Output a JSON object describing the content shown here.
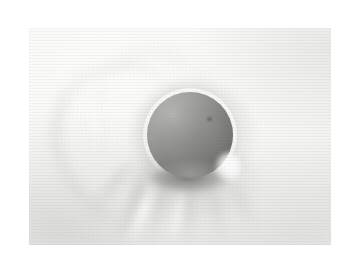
{
  "page": {
    "background_color": "#ffffff",
    "width": 359,
    "height": 261
  },
  "photo": {
    "subject": "gray ball resting on white cloth",
    "alt_text": "A soft gray spherical ball resting on a creased white fabric surface, lit from the upper left",
    "frame": {
      "x": 29,
      "y": 28,
      "width": 302,
      "height": 217
    },
    "background_color": "#f7f7f5",
    "lighting": "upper-left key light, soft diffuse shadow to lower right"
  },
  "elements": {
    "ball": {
      "name": "gray ball",
      "center_x": 190,
      "center_y": 135,
      "diameter": 86,
      "highlight_color": "#b4b4b2",
      "core_color": "#828280",
      "shadow_color": "#7b7b79"
    },
    "gloss": {
      "name": "specular highlight",
      "position": "lower-right rim of ball",
      "color": "#ffffff"
    },
    "contact_shadow": {
      "name": "contact shadow",
      "position": "directly beneath ball",
      "color": "#5a5a58"
    },
    "cloth": {
      "name": "white cloth backdrop",
      "color": "#fafaf9",
      "fold_shadow_color": "#b6b6b4",
      "fold_highlight_color": "#ffffff"
    }
  }
}
